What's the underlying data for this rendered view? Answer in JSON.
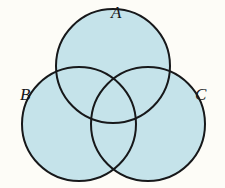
{
  "figure": {
    "name": "three-set-venn-diagram",
    "background_color": "#fdfcf7"
  },
  "labels": {
    "a": "A",
    "b": "B",
    "c": "C"
  },
  "style": {
    "fill_color": "#c5e3ea",
    "stroke_color": "#17181a",
    "stroke_width": 2,
    "label_color": "#16171a"
  },
  "chart_data": {
    "type": "diagram",
    "diagram_kind": "venn",
    "set_count": 3,
    "title": "",
    "sets": [
      {
        "label": "A",
        "cx": 113,
        "cy": 66,
        "r": 57,
        "label_x": 118,
        "label_y": 13
      },
      {
        "label": "B",
        "cx": 79,
        "cy": 124,
        "r": 57,
        "label_x": 27,
        "label_y": 95
      },
      {
        "label": "C",
        "cx": 148,
        "cy": 124,
        "r": 57,
        "label_x": 202,
        "label_y": 95
      }
    ],
    "fill_color": "#c5e3ea",
    "stroke_color": "#17181a",
    "all_regions_shaded": true,
    "shaded_regions": [
      "A",
      "B",
      "C",
      "AB",
      "AC",
      "BC",
      "ABC"
    ],
    "canvas": {
      "width": 225,
      "height": 188
    }
  }
}
